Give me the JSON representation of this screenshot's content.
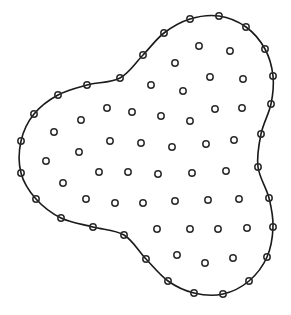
{
  "diagram": {
    "colors": {
      "background": "#ffffff",
      "stroke": "#1a1a1a"
    },
    "node_radius": 3.2,
    "boundary_nodes": [
      [
        143,
        55
      ],
      [
        164,
        33
      ],
      [
        190,
        19
      ],
      [
        219,
        16
      ],
      [
        246,
        27
      ],
      [
        265,
        49
      ],
      [
        273,
        76
      ],
      [
        271,
        104
      ],
      [
        261,
        134
      ],
      [
        258,
        167
      ],
      [
        269,
        198
      ],
      [
        273,
        227
      ],
      [
        267,
        257
      ],
      [
        249,
        281
      ],
      [
        223,
        294
      ],
      [
        194,
        293
      ],
      [
        168,
        281
      ],
      [
        146,
        259
      ],
      [
        124,
        235
      ],
      [
        93,
        227
      ],
      [
        61,
        218
      ],
      [
        36,
        199
      ],
      [
        21,
        173
      ],
      [
        21,
        141
      ],
      [
        34,
        114
      ],
      [
        58,
        95
      ],
      [
        87,
        85
      ],
      [
        120,
        78
      ]
    ],
    "interior_nodes": [
      [
        199,
        46
      ],
      [
        230,
        51
      ],
      [
        175,
        63
      ],
      [
        210,
        77
      ],
      [
        243,
        79
      ],
      [
        151,
        85
      ],
      [
        183,
        91
      ],
      [
        215,
        109
      ],
      [
        242,
        108
      ],
      [
        107,
        108
      ],
      [
        132,
        112
      ],
      [
        161,
        116
      ],
      [
        190,
        121
      ],
      [
        81,
        120
      ],
      [
        54,
        132
      ],
      [
        110,
        141
      ],
      [
        141,
        143
      ],
      [
        172,
        147
      ],
      [
        206,
        144
      ],
      [
        234,
        140
      ],
      [
        79,
        152
      ],
      [
        46,
        161
      ],
      [
        99,
        172
      ],
      [
        128,
        172
      ],
      [
        158,
        174
      ],
      [
        192,
        173
      ],
      [
        226,
        171
      ],
      [
        63,
        183
      ],
      [
        86,
        199
      ],
      [
        115,
        203
      ],
      [
        143,
        203
      ],
      [
        175,
        201
      ],
      [
        208,
        200
      ],
      [
        239,
        199
      ],
      [
        157,
        229
      ],
      [
        190,
        229
      ],
      [
        218,
        229
      ],
      [
        247,
        228
      ],
      [
        177,
        255
      ],
      [
        205,
        263
      ],
      [
        233,
        258
      ]
    ]
  }
}
